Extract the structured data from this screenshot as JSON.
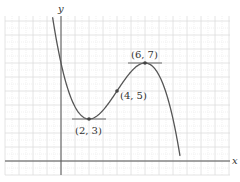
{
  "chart_data": {
    "type": "line",
    "title": "",
    "xlabel": "x",
    "ylabel": "y",
    "xlim": [
      -4,
      12
    ],
    "ylim": [
      -1,
      10
    ],
    "grid": true,
    "function": "f(x) = -x^3/8 + 3x^2/2 - 9x/2 + 7",
    "series": [
      {
        "name": "cubic curve",
        "x_range": [
          -0.6,
          8.5
        ],
        "color": "#555555"
      }
    ],
    "annotations": [
      {
        "label": "(2, 3)",
        "x": 2,
        "y": 3,
        "kind": "local minimum",
        "tangent": true
      },
      {
        "label": "(4, 5)",
        "x": 4,
        "y": 5,
        "kind": "inflection point",
        "tangent": false
      },
      {
        "label": "(6, 7)",
        "x": 6,
        "y": 7,
        "kind": "local maximum",
        "tangent": true
      }
    ]
  },
  "labels": {
    "x_axis": "x",
    "y_axis": "y",
    "min_point": "(2, 3)",
    "inflection_point": "(4, 5)",
    "max_point": "(6, 7)"
  },
  "colors": {
    "curve": "#555555",
    "axis": "#555555",
    "grid_major": "#dddddd",
    "grid_minor": "#eeeeee"
  }
}
